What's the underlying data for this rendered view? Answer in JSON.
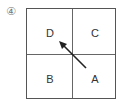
{
  "figure_number": "④",
  "grid": {
    "cells": [
      {
        "position": "top-left",
        "label": "D"
      },
      {
        "position": "top-right",
        "label": "C"
      },
      {
        "position": "bottom-left",
        "label": "B"
      },
      {
        "position": "bottom-right",
        "label": "A"
      }
    ]
  },
  "arrow": {
    "from": "A",
    "to": "D",
    "color": "#222222"
  }
}
